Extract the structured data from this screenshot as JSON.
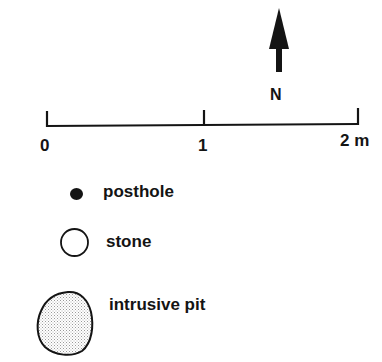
{
  "north_arrow": {
    "label": "N",
    "icon": "north-arrow-icon"
  },
  "scale_bar": {
    "ticks": [
      {
        "label": "0"
      },
      {
        "label": "1"
      },
      {
        "label": "2 m"
      }
    ]
  },
  "legend": {
    "items": [
      {
        "symbol": "filled-dot",
        "label": "posthole"
      },
      {
        "symbol": "open-circle",
        "label": "stone"
      },
      {
        "symbol": "stippled-blob",
        "label": "intrusive pit"
      }
    ]
  },
  "colors": {
    "ink": "#141414",
    "stipple": "#bdbdbd",
    "background": "#ffffff"
  }
}
